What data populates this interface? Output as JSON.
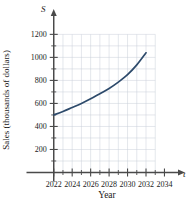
{
  "chart_data": {
    "type": "line",
    "title": "",
    "xlabel": "Year",
    "ylabel": "Sales (thousands of dollars)",
    "x_axis_symbol": "t",
    "y_axis_symbol": "S",
    "xlim": [
      2021,
      2034.6
    ],
    "ylim": [
      0,
      1290
    ],
    "grid": true,
    "grid_x_range": [
      2022,
      2033
    ],
    "grid_y_range": [
      0,
      1200
    ],
    "grid_x_step": 1,
    "grid_y_step": 100,
    "legend_position": "none",
    "xticks": [
      2022,
      2024,
      2026,
      2028,
      2030,
      2032,
      2034
    ],
    "xtick_labels": [
      "2022",
      "2024",
      "2026",
      "2028",
      "2030",
      "2032",
      "2034"
    ],
    "x_minor_ticks": [
      2023,
      2025,
      2027,
      2029,
      2031,
      2033
    ],
    "yticks": [
      200,
      400,
      600,
      800,
      1000,
      1200
    ],
    "ytick_labels": [
      "200",
      "400",
      "600",
      "800",
      "1000",
      "1200"
    ],
    "y_minor_ticks": [
      100,
      300,
      500,
      700,
      900,
      1100
    ],
    "series": [
      {
        "name": "Sales",
        "color": "#2d4a6b",
        "x": [
          2022,
          2023,
          2024,
          2025,
          2026,
          2027,
          2028,
          2029,
          2030,
          2031,
          2032
        ],
        "values": [
          500,
          530,
          565,
          600,
          640,
          685,
          730,
          785,
          850,
          935,
          1040
        ]
      }
    ]
  },
  "figure": {
    "background_color": "#ffffff",
    "grid_color": "#c9cfd8",
    "axis_color": "#4a4a4a",
    "curve_color": "#2d4a6b"
  }
}
